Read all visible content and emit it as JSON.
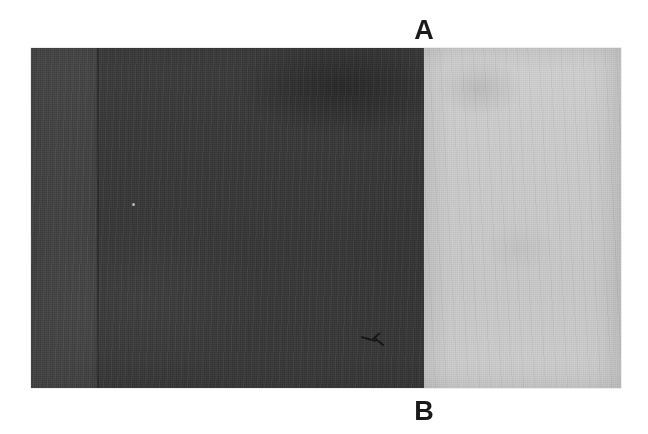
{
  "figure": {
    "type": "grayscale-micrograph-panel",
    "caption_labels": {
      "top": "A",
      "bottom": "B"
    },
    "plate": {
      "x": 31,
      "y": 48,
      "width": 590,
      "height": 340,
      "border_color": "#9a9a9a",
      "regions": [
        {
          "id": "region-a",
          "label": "A",
          "position": "left",
          "tone": "dark",
          "fill_color": "#3a3a3a",
          "x": 0,
          "width": 393,
          "features": [
            "vertical seam line at x=66",
            "darker diffuse patch upper right",
            "small dark scratch artifact lower right",
            "single bright speck mid-left"
          ]
        },
        {
          "id": "region-b",
          "label": "B",
          "position": "right",
          "tone": "light",
          "fill_color": "#c9c9c9",
          "x": 393,
          "width": 197,
          "features": [
            "faint dark smudge upper left",
            "subtle mottling throughout"
          ]
        }
      ],
      "boundary_x": 393
    },
    "background_color": "#ffffff",
    "label_color": "#1a1a1a"
  }
}
